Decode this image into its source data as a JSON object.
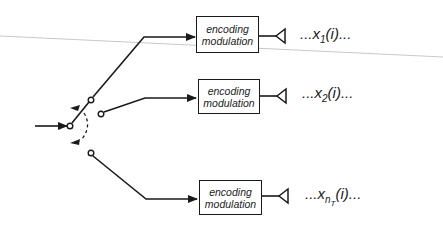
{
  "diagram": {
    "type": "transmitter switching / antenna selection",
    "branches": [
      {
        "block_line1": "encoding",
        "block_line2": "modulation",
        "signal_prefix": "...x",
        "signal_sub": "1",
        "signal_sub2": "",
        "signal_suffix": "(i)..."
      },
      {
        "block_line1": "encoding",
        "block_line2": "modulation",
        "signal_prefix": "...x",
        "signal_sub": "2",
        "signal_sub2": "",
        "signal_suffix": "(i)..."
      },
      {
        "block_line1": "encoding",
        "block_line2": "modulation",
        "signal_prefix": "...x",
        "signal_sub": "n",
        "signal_sub2": "T",
        "signal_suffix": "(i)..."
      }
    ],
    "colors": {
      "line": "#1a1a1a",
      "background": "#ffffff",
      "scan_line": "#c8c8c8"
    }
  }
}
